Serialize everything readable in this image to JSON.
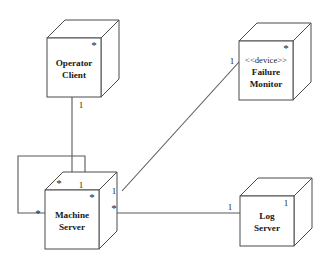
{
  "diagram": {
    "kind": "uml-deployment-diagram",
    "background_color": "#ffffff",
    "line_color": "#58585a",
    "node_border_color": "#4a4a4a",
    "text_color": "#18181a",
    "nodes": [
      {
        "id": "operator-client",
        "stereotype": "",
        "name_line1": "Operator",
        "name_line2": "Client",
        "corner_multiplicity": "*"
      },
      {
        "id": "failure-monitor",
        "stereotype": "<<device>>",
        "name_line1": "Failure",
        "name_line2": "Monitor",
        "corner_multiplicity": "*"
      },
      {
        "id": "machine-server",
        "stereotype": "",
        "name_line1": "Machine",
        "name_line2": "Server",
        "corner_multiplicity": "*"
      },
      {
        "id": "log-server",
        "stereotype": "",
        "name_line1": "Log",
        "name_line2": "Server",
        "corner_multiplicity": "1"
      }
    ],
    "associations": [
      {
        "id": "operator-client-to-machine-server",
        "from": "operator-client",
        "to": "machine-server",
        "from_multiplicity": "1",
        "to_multiplicity": "1"
      },
      {
        "id": "machine-server-to-failure-monitor",
        "from": "machine-server",
        "to": "failure-monitor",
        "from_multiplicity": "1",
        "to_multiplicity": "1"
      },
      {
        "id": "machine-server-to-log-server",
        "from": "machine-server",
        "to": "log-server",
        "from_multiplicity": "*",
        "to_multiplicity": "1"
      },
      {
        "id": "machine-server-self-association",
        "from": "machine-server",
        "to": "machine-server",
        "from_multiplicity": "*",
        "to_multiplicity": "*"
      }
    ]
  }
}
